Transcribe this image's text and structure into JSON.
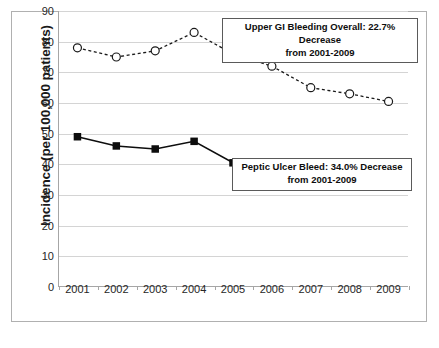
{
  "chart_data": {
    "type": "line",
    "title": "",
    "xlabel": "",
    "ylabel": "Incidence (per 100,000 patients)",
    "categories": [
      "2001",
      "2002",
      "2003",
      "2004",
      "2005",
      "2006",
      "2007",
      "2008",
      "2009"
    ],
    "ylim": [
      0,
      90
    ],
    "ytick_step": 10,
    "yticks": [
      "90",
      "80",
      "70",
      "60",
      "50",
      "40",
      "30",
      "20",
      "10",
      "0"
    ],
    "grid": true,
    "legend": "none",
    "series": [
      {
        "name": "Upper GI Bleeding Overall",
        "marker": "open-circle",
        "line_style": "dotted",
        "color": "#1a1a1a",
        "values": [
          78,
          75,
          77,
          83,
          76,
          72,
          65,
          63,
          60.5
        ]
      },
      {
        "name": "Peptic Ulcer Bleed",
        "marker": "filled-square",
        "line_style": "solid",
        "color": "#0d0d0d",
        "values": [
          49,
          46,
          45,
          47.5,
          40.5,
          39.5,
          35,
          33.5,
          33
        ]
      }
    ],
    "annotations": [
      {
        "id": "upper",
        "line1": "Upper GI Bleeding Overall: 22.7% Decrease",
        "line2": "from 2001-2009"
      },
      {
        "id": "lower",
        "line1": "Peptic Ulcer Bleed: 34.0% Decrease",
        "line2": "from 2001-2009"
      }
    ]
  },
  "caption": ""
}
